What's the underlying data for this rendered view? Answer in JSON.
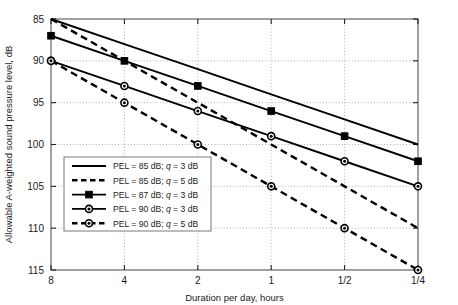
{
  "chart_data": {
    "type": "line",
    "title": "",
    "xlabel": "Duration per day, hours",
    "ylabel": "Allowable A-weighted sound pressure level, dB",
    "x_tick_labels": [
      "8",
      "4",
      "2",
      "1",
      "1/2",
      "1/4"
    ],
    "x_positions": [
      0,
      1,
      2,
      3,
      4,
      5
    ],
    "y_tick_labels": [
      "85",
      "90",
      "95",
      "100",
      "105",
      "110",
      "115"
    ],
    "ylim": [
      85,
      115
    ],
    "y_inverted": true,
    "grid": true,
    "legend_position": "lower-left-inside",
    "series": [
      {
        "name": "PEL = 85 dB; q = 3 dB",
        "pel": 85,
        "q": 3,
        "style": "solid",
        "marker": "none",
        "values": [
          85,
          88,
          91,
          94,
          97,
          100
        ]
      },
      {
        "name": "PEL = 85 dB; q = 5 dB",
        "pel": 85,
        "q": 5,
        "style": "dashed",
        "marker": "none",
        "values": [
          85,
          90,
          95,
          100,
          105,
          110
        ]
      },
      {
        "name": "PEL = 87 dB; q = 3 dB",
        "pel": 87,
        "q": 3,
        "style": "solid",
        "marker": "square",
        "values": [
          87,
          90,
          93,
          96,
          99,
          102
        ]
      },
      {
        "name": "PEL = 90 dB; q = 3 dB",
        "pel": 90,
        "q": 3,
        "style": "solid",
        "marker": "circle",
        "values": [
          90,
          93,
          96,
          99,
          102,
          105
        ]
      },
      {
        "name": "PEL = 90 dB; q = 5 dB",
        "pel": 90,
        "q": 5,
        "style": "dashed",
        "marker": "circle",
        "values": [
          90,
          95,
          100,
          105,
          110,
          115
        ]
      }
    ],
    "legend_entries": [
      {
        "label": "PEL = 85 dB; q = 3 dB",
        "style": "solid",
        "marker": "none"
      },
      {
        "label": "PEL = 85 dB; q = 5 dB",
        "style": "dashed",
        "marker": "none"
      },
      {
        "label": "PEL = 87 dB; q = 3 dB",
        "style": "solid",
        "marker": "square"
      },
      {
        "label": "PEL = 90 dB; q = 3 dB",
        "style": "solid",
        "marker": "circle"
      },
      {
        "label": "PEL = 90 dB; q = 5 dB",
        "style": "dashed",
        "marker": "circle"
      }
    ],
    "colors": {
      "line": "#000000",
      "grid": "#9a9a9a",
      "axis": "#555555",
      "background": "#ffffff"
    }
  },
  "ticks": {
    "x": [
      "8",
      "4",
      "2",
      "1",
      "1/2",
      "1/4"
    ],
    "y": [
      "85",
      "90",
      "95",
      "100",
      "105",
      "110",
      "115"
    ]
  },
  "axis_titles": {
    "x": "Duration per day, hours",
    "y": "Allowable A-weighted sound pressure level, dB"
  },
  "legend": {
    "item0": "PEL = 85 dB; q = 3 dB",
    "item1": "PEL = 85 dB; q = 5 dB",
    "item2": "PEL = 87 dB; q = 3 dB",
    "item3": "PEL = 90 dB; q = 3 dB",
    "item4": "PEL = 90 dB; q = 5 dB"
  }
}
